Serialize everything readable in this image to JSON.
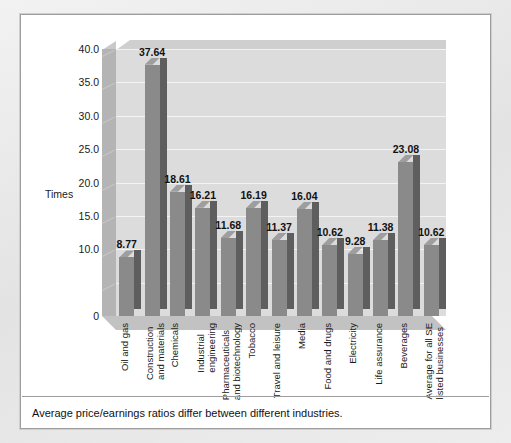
{
  "caption": "Average price/earnings ratios differ between different industries.",
  "axis_title": "Times",
  "yticks": [
    "40.0",
    "35.0",
    "30.0",
    "25.0",
    "20.0",
    "15.0",
    "10.0",
    "0"
  ],
  "colors": {
    "bar_front": "#8a8a8a",
    "bar_side": "#5e5e5e",
    "bar_top": "#9e9e9e",
    "plot_background": "#dcdcdc",
    "gridline": "#f3f3f3",
    "panel_background": "#ffffff",
    "frame": "#e9e9e9"
  },
  "chart_data": {
    "type": "bar",
    "title": "",
    "subtitle": "",
    "xlabel": "",
    "ylabel": "Times",
    "ylim": [
      0,
      40
    ],
    "ytick_values": [
      0,
      10,
      15,
      20,
      25,
      30,
      35,
      40
    ],
    "grid": true,
    "legend": "none",
    "categories": [
      "Oil and gas",
      "Construction and materials",
      "Chemicals",
      "Industrial engineering",
      "Pharmaceuticals and biotechnology",
      "Tobacco",
      "Travel and leisure",
      "Media",
      "Food and drugs",
      "Electricity",
      "Life assurance",
      "Beverages",
      "Average for all SE listed businesses"
    ],
    "category_lines": [
      [
        "Oil and gas"
      ],
      [
        "Construction",
        "and materials"
      ],
      [
        "Chemicals"
      ],
      [
        "Industrial",
        "engineering"
      ],
      [
        "Pharmaceuticals",
        "and biotechnology"
      ],
      [
        "Tobacco"
      ],
      [
        "Travel and leisure"
      ],
      [
        "Media"
      ],
      [
        "Food and drugs"
      ],
      [
        "Electricity"
      ],
      [
        "Life assurance"
      ],
      [
        "Beverages"
      ],
      [
        "Average for all SE",
        "listed businesses"
      ]
    ],
    "values": [
      8.77,
      37.64,
      18.61,
      16.21,
      11.68,
      16.19,
      11.37,
      16.04,
      10.62,
      9.28,
      11.38,
      23.08,
      10.62
    ],
    "value_labels": [
      "8.77",
      "37.64",
      "18.61",
      "16.21",
      "11.68",
      "16.19",
      "11.37",
      "16.04",
      "10.62",
      "9.28",
      "11.38",
      "23.08",
      "10.62"
    ],
    "annotation": "Average price/earnings ratios differ between different industries."
  }
}
